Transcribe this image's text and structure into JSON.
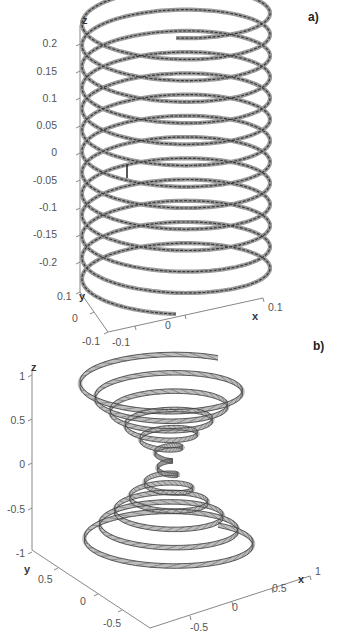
{
  "chart_data": [
    {
      "panel": "a)",
      "type": "line",
      "subtype": "3d-helix",
      "title": "",
      "description": "Cylindrical helical ribbon of constant radius",
      "xlabel": "x",
      "ylabel": "y",
      "zlabel": "z",
      "xlim": [
        -0.1,
        0.1
      ],
      "ylim": [
        -0.1,
        0.1
      ],
      "zlim": [
        -0.25,
        0.25
      ],
      "x_ticks": [
        "-0.1",
        "0",
        "0.1"
      ],
      "y_ticks": [
        "0.1",
        "0",
        "-0.1"
      ],
      "z_ticks": [
        "0.2",
        "0.15",
        "0.1",
        "0.05",
        "0",
        "-0.05",
        "-0.1",
        "-0.15",
        "-0.2"
      ],
      "helix": {
        "radius": 0.1,
        "turns": 13,
        "z_start": -0.24,
        "z_end": 0.24
      },
      "grid": false,
      "legend": null
    },
    {
      "panel": "b)",
      "type": "line",
      "subtype": "3d-conical-helix",
      "title": "",
      "description": "Double-cone (hourglass) helical ribbon, radius proportional to |z|",
      "xlabel": "x",
      "ylabel": "y",
      "zlabel": "z",
      "xlim": [
        -1,
        1
      ],
      "ylim": [
        -1,
        1
      ],
      "zlim": [
        -1,
        1
      ],
      "x_ticks": [
        "-0.5",
        "0",
        "0.5",
        "1"
      ],
      "y_ticks": [
        "0.5",
        "0",
        "-0.5"
      ],
      "z_ticks": [
        "1",
        "0.5",
        "0",
        "-0.5",
        "-1"
      ],
      "helix": {
        "radius_at_z1": 1.0,
        "turns": 12,
        "z_start": -0.95,
        "z_end": 0.95
      },
      "grid": false,
      "legend": null
    }
  ],
  "panels": {
    "a": {
      "label": "a)",
      "axis_names": {
        "x": "x",
        "y": "y",
        "z": "z"
      },
      "z_ticks": [
        "0.2",
        "0.15",
        "0.1",
        "0.05",
        "0",
        "-0.05",
        "-0.1",
        "-0.15",
        "-0.2"
      ],
      "y_ticks": [
        "0.1",
        "0",
        "-0.1"
      ],
      "x_ticks": [
        "-0.1",
        "0",
        "0.1"
      ]
    },
    "b": {
      "label": "b)",
      "axis_names": {
        "x": "x",
        "y": "y",
        "z": "z"
      },
      "z_ticks": [
        "1",
        "0.5",
        "0",
        "-0.5",
        "-1"
      ],
      "y_ticks": [
        "0.5",
        "0",
        "-0.5"
      ],
      "x_ticks": [
        "-0.5",
        "0",
        "0.5",
        "1"
      ]
    }
  },
  "colors": {
    "axis": "#888888",
    "ribbon_edge": "#333333",
    "ribbon_fill": "#bdbdbd",
    "text": "#555555"
  }
}
